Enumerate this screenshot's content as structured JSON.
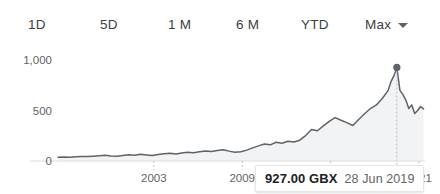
{
  "widget": {
    "title": "Stock price history chart"
  },
  "range_selector": {
    "tabs": [
      {
        "label": "1D",
        "selected": false
      },
      {
        "label": "5D",
        "selected": false
      },
      {
        "label": "1 M",
        "selected": false
      },
      {
        "label": "6 M",
        "selected": false
      },
      {
        "label": "YTD",
        "selected": false
      },
      {
        "label": "Max",
        "selected": true
      }
    ],
    "dropdown_icon": "chevron-down-icon"
  },
  "tooltip": {
    "price": "927.00 GBX",
    "date": "28 Jun 2019",
    "marker_icon": "data-point-marker"
  },
  "colors": {
    "line": "#5f6368",
    "area_fill": "#f1f3f4",
    "axis": "#dadce0",
    "tick_text": "#5f6368",
    "tab_text": "#3c4043",
    "tooltip_price_text": "#202124",
    "tooltip_date_text": "#5f6368",
    "background": "#ffffff",
    "guideline": "#bdc1c6"
  },
  "chart_data": {
    "type": "line",
    "title": "",
    "xlabel": "",
    "ylabel": "",
    "unit": "GBX",
    "grid": false,
    "legend": "none",
    "area_under_line": true,
    "xlim": [
      1996.5,
      2021.4
    ],
    "ylim": [
      0,
      1100
    ],
    "y_ticks": [
      0,
      500,
      1000
    ],
    "y_tick_labels": [
      "0",
      "500",
      "1,000"
    ],
    "x_ticks": [
      2003,
      2009,
      2015,
      2021
    ],
    "x_tick_labels": [
      "2003",
      "2009",
      "2015",
      "2021"
    ],
    "highlight": {
      "x": 2019.49,
      "y": 927,
      "label": "927.00 GBX",
      "date": "28 Jun 2019",
      "show_vertical_guide": true,
      "show_marker_dot": true
    },
    "series": [
      {
        "name": "Share price",
        "unit": "GBX",
        "x": [
          1996.5,
          1996.9,
          1997.3,
          1997.7,
          1998.1,
          1998.5,
          1998.9,
          1999.3,
          1999.7,
          2000.1,
          2000.5,
          2000.9,
          2001.3,
          2001.7,
          2002.1,
          2002.5,
          2002.9,
          2003.3,
          2003.7,
          2004.1,
          2004.5,
          2004.9,
          2005.3,
          2005.7,
          2006.1,
          2006.5,
          2006.9,
          2007.3,
          2007.7,
          2008.1,
          2008.5,
          2008.9,
          2009.3,
          2009.7,
          2010.1,
          2010.5,
          2010.9,
          2011.3,
          2011.7,
          2012.1,
          2012.5,
          2012.9,
          2013.3,
          2013.7,
          2014.1,
          2014.5,
          2014.9,
          2015.3,
          2015.7,
          2016.1,
          2016.5,
          2016.9,
          2017.3,
          2017.7,
          2018.1,
          2018.5,
          2018.9,
          2019.1,
          2019.3,
          2019.49,
          2019.7,
          2019.9,
          2020.1,
          2020.3,
          2020.5,
          2020.7,
          2020.9,
          2021.1,
          2021.3
        ],
        "y": [
          38,
          40,
          36,
          42,
          45,
          44,
          48,
          52,
          56,
          50,
          46,
          55,
          62,
          58,
          66,
          60,
          55,
          64,
          72,
          76,
          70,
          80,
          86,
          82,
          92,
          98,
          94,
          104,
          112,
          98,
          86,
          92,
          108,
          130,
          150,
          168,
          160,
          186,
          176,
          196,
          188,
          206,
          252,
          312,
          300,
          348,
          392,
          430,
          404,
          380,
          352,
          412,
          468,
          520,
          556,
          620,
          700,
          790,
          846,
          927,
          700,
          660,
          604,
          520,
          556,
          470,
          500,
          540,
          516
        ]
      }
    ]
  }
}
